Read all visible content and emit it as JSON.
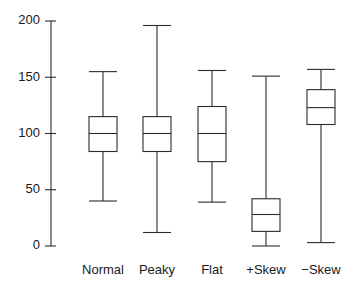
{
  "chart_data": {
    "type": "box",
    "title": "",
    "xlabel": "",
    "ylabel": "",
    "ylim": [
      0,
      200
    ],
    "grid": false,
    "legend": null,
    "axis": {
      "tick_labels": [
        "200",
        "150",
        "100",
        "50",
        "0"
      ],
      "tick_values": [
        200,
        150,
        100,
        50,
        0
      ]
    },
    "categories": [
      "Normal",
      "Peaky",
      "Flat",
      "+Skew",
      "−Skew"
    ],
    "boxes": [
      {
        "label": "Normal",
        "whisker_low": 40,
        "q1": 84,
        "median": 100,
        "q3": 115,
        "whisker_high": 155
      },
      {
        "label": "Peaky",
        "whisker_low": 12,
        "q1": 84,
        "median": 100,
        "q3": 115,
        "whisker_high": 196
      },
      {
        "label": "Flat",
        "whisker_low": 39,
        "q1": 75,
        "median": 100,
        "q3": 124,
        "whisker_high": 156
      },
      {
        "label": "+Skew",
        "whisker_low": 0,
        "q1": 13,
        "median": 28,
        "q3": 42,
        "whisker_high": 151
      },
      {
        "label": "−Skew",
        "whisker_low": 3,
        "q1": 108,
        "median": 123,
        "q3": 139,
        "whisker_high": 157
      }
    ],
    "colors": {
      "stroke": "#2b2b2b",
      "fill": "#ffffff",
      "text": "#1a1a1a",
      "background": "#ffffff"
    }
  },
  "geometry": {
    "axis_x": 51,
    "tick_left": 45,
    "y_top_px": 21,
    "y_bottom_px": 246,
    "box_width": 28,
    "centers": [
      103,
      157,
      212,
      266,
      321
    ],
    "label_y": 271,
    "tick_label_x": 40
  }
}
